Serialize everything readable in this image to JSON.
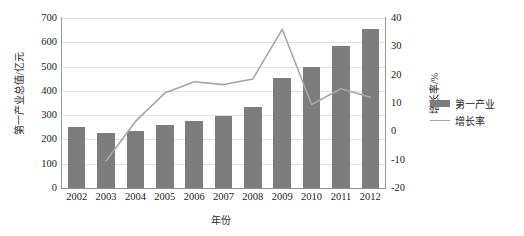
{
  "chart_data": {
    "type": "bar",
    "title": "",
    "xlabel": "年份",
    "ylabel": "第一产业总值/亿元",
    "y2label": "增长率/%",
    "categories": [
      "2002",
      "2003",
      "2004",
      "2005",
      "2006",
      "2007",
      "2008",
      "2009",
      "2010",
      "2011",
      "2012"
    ],
    "ylim": [
      0,
      700
    ],
    "yticks": [
      "0",
      "100",
      "200",
      "300",
      "400",
      "500",
      "600",
      "700"
    ],
    "y2lim": [
      -20,
      40
    ],
    "y2ticks": [
      "-20",
      "-10",
      "0",
      "10",
      "20",
      "30",
      "40"
    ],
    "grid": true,
    "legend_position": "right",
    "series": [
      {
        "name": "第一产业",
        "kind": "bar",
        "axis": "left",
        "color": "#7d7d7d",
        "values": [
          250,
          228,
          236,
          258,
          276,
          298,
          334,
          452,
          500,
          583,
          655
        ]
      },
      {
        "name": "增长率",
        "kind": "line",
        "axis": "right",
        "color": "#a6a6a6",
        "values": [
          null,
          -10.5,
          3.5,
          13.5,
          17.5,
          16.5,
          18.5,
          36.0,
          9.5,
          15.0,
          12.0
        ]
      }
    ]
  },
  "legend": {
    "items": [
      {
        "label": "第一产业",
        "marker": "bar-swatch"
      },
      {
        "label": "增长率",
        "marker": "line-swatch"
      }
    ]
  }
}
